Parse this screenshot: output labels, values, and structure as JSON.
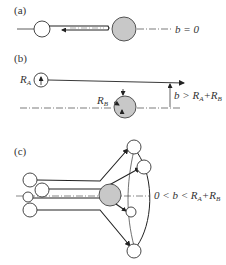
{
  "figure": {
    "panels": [
      {
        "id": "a",
        "label": "(a)",
        "condition": "b = 0",
        "description": "Head-on collision: sphere A travels along line of centers toward sphere B and rebounds"
      },
      {
        "id": "b",
        "label": "(b)",
        "radius_a_label": "R",
        "radius_a_sub": "A",
        "radius_b_label": "R",
        "radius_b_sub": "B",
        "condition_prefix": "b > R",
        "condition_sub1": "A",
        "condition_mid": "+R",
        "condition_sub2": "B",
        "description": "Impact parameter exceeds sum of radii: no collision, A passes by B"
      },
      {
        "id": "c",
        "label": "(c)",
        "condition_prefix": "0 < b < R",
        "condition_sub1": "A",
        "condition_mid": "+R",
        "condition_sub2": "B",
        "description": "Intermediate impact parameter: spheres A deflected at various angles by B"
      }
    ],
    "colors": {
      "line": "#222222",
      "target_fill": "#c8c8c8",
      "target_stroke": "#444444",
      "projectile_fill": "#ffffff"
    }
  }
}
